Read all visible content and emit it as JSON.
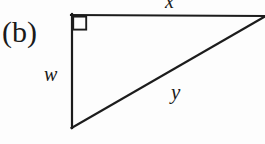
{
  "figure": {
    "panel_label": "(b)",
    "background_color": "#fefefe",
    "stroke_color": "#1c1c1c",
    "stroke_width": 2,
    "canvas": {
      "width": 265,
      "height": 144
    },
    "labels": {
      "top_side": "x",
      "left_side": "w",
      "hypotenuse": "y"
    },
    "right_angle_marker": {
      "name": "right-angle-square",
      "at_vertex": "top-left",
      "size": 13
    },
    "vertices": {
      "top_left": {
        "x": 72,
        "y": 15
      },
      "top_right": {
        "x": 263,
        "y": 16
      },
      "bottom_left": {
        "x": 72,
        "y": 128
      }
    },
    "sides": [
      {
        "name": "top-leg",
        "label": "x",
        "from": "top_left",
        "to": "top_right"
      },
      {
        "name": "left-leg",
        "label": "w",
        "from": "top_left",
        "to": "bottom_left"
      },
      {
        "name": "hypotenuse",
        "label": "y",
        "from": "bottom_left",
        "to": "top_right"
      }
    ]
  }
}
